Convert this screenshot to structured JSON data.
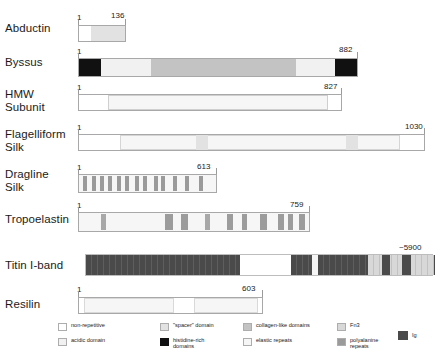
{
  "figure": {
    "type": "domain-map"
  },
  "proteins": [
    {
      "name": "Abductin",
      "start_label": "1",
      "end_label": "136",
      "segments": [
        {
          "type": "non-repetitive",
          "label": "non-repetitive"
        },
        {
          "type": "spacer",
          "label": "\"spacer\" domain"
        }
      ]
    },
    {
      "name": "Byssus",
      "start_label": "1",
      "end_label": "882",
      "segments": [
        {
          "type": "histidine-rich",
          "label": "histidine-rich domains"
        },
        {
          "type": "acidic",
          "label": "acidic domain"
        },
        {
          "type": "collagen-like",
          "label": "collagen-like domains"
        },
        {
          "type": "acidic",
          "label": "acidic domain"
        },
        {
          "type": "histidine-rich",
          "label": "histidine-rich domains"
        }
      ]
    },
    {
      "name": "HMW\nSubunit",
      "start_label": "1",
      "end_label": "827",
      "segments": [
        {
          "type": "non-repetitive",
          "label": "non-repetitive"
        },
        {
          "type": "elastic-repeats",
          "label": "elastic repeats"
        },
        {
          "type": "non-repetitive",
          "label": "non-repetitive"
        }
      ]
    },
    {
      "name": "Flagelliform\nSilk",
      "start_label": "1",
      "end_label": "1030",
      "segments": [
        {
          "type": "non-repetitive",
          "label": "non-repetitive"
        },
        {
          "type": "elastic-repeats",
          "label": "elastic repeats"
        },
        {
          "type": "spacer",
          "label": "\"spacer\" domain"
        },
        {
          "type": "elastic-repeats",
          "label": "elastic repeats"
        },
        {
          "type": "spacer",
          "label": "\"spacer\" domain"
        },
        {
          "type": "elastic-repeats",
          "label": "elastic repeats"
        },
        {
          "type": "non-repetitive",
          "label": "non-repetitive"
        }
      ]
    },
    {
      "name": "Dragline\nSilk",
      "start_label": "1",
      "end_label": "613",
      "segments": [
        {
          "type": "elastic-repeats",
          "label": "elastic repeats"
        },
        {
          "type": "polyalanine",
          "label": "polyalanine repeats"
        }
      ]
    },
    {
      "name": "Tropoelastin",
      "start_label": "1",
      "end_label": "759",
      "segments": [
        {
          "type": "elastic-repeats",
          "label": "elastic repeats"
        },
        {
          "type": "collagen-like",
          "label": "collagen-like domains"
        }
      ]
    },
    {
      "name": "Titin I-band",
      "start_label": "",
      "end_label": "~5900",
      "segments": [
        {
          "type": "Ig",
          "label": "Ig"
        },
        {
          "type": "non-repetitive",
          "label": "non-repetitive"
        },
        {
          "type": "Fn3",
          "label": "Fn3"
        }
      ]
    },
    {
      "name": "Resilin",
      "start_label": "1",
      "end_label": "603",
      "segments": [
        {
          "type": "elastic-repeats",
          "label": "elastic repeats"
        },
        {
          "type": "non-repetitive",
          "label": "non-repetitive"
        }
      ]
    }
  ],
  "legend": {
    "items": [
      {
        "key": "non-repetitive",
        "label": "non-repetitive",
        "color": "#ffffff"
      },
      {
        "key": "acidic-domain",
        "label": "acidic domain",
        "color": "#f1f1f1"
      },
      {
        "key": "spacer-domain",
        "label": "\"spacer\" domain",
        "color": "#e2e2e2"
      },
      {
        "key": "histidine-rich-domains",
        "label": "histidine-rich\ndomains",
        "color": "#111111"
      },
      {
        "key": "collagen-like-domains",
        "label": "collagen-like domains",
        "color": "#c3c3c3"
      },
      {
        "key": "elastic-repeats",
        "label": "elastic repeats",
        "color": "#f6f6f6"
      },
      {
        "key": "fn3",
        "label": "Fn3",
        "color": "#d8d8d8"
      },
      {
        "key": "polyalanine-repeats",
        "label": "polyalanine\nrepeats",
        "color": "#9a9a9a"
      },
      {
        "key": "ig",
        "label": "Ig",
        "color": "#4a4a4a"
      }
    ]
  }
}
